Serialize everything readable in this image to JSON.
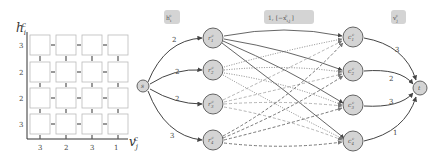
{
  "grid": {
    "y_axis_label": "h",
    "y_axis_sub": "i",
    "y_axis_sup": "c",
    "x_axis_label": "v",
    "x_axis_sub": "j",
    "x_axis_sup": "c",
    "row_labels": [
      "3",
      "2",
      "2",
      "3"
    ],
    "col_labels": [
      "3",
      "2",
      "3",
      "1"
    ],
    "rows": 4,
    "cols": 4
  },
  "network": {
    "source": {
      "label": "s"
    },
    "sink": {
      "label": "t"
    },
    "left_nodes": [
      {
        "label": "r",
        "sub": "1",
        "sup": "c"
      },
      {
        "label": "r",
        "sub": "2",
        "sup": "c"
      },
      {
        "label": "r",
        "sub": "3",
        "sup": "c"
      },
      {
        "label": "r",
        "sub": "4",
        "sup": "c"
      }
    ],
    "right_nodes": [
      {
        "label": "c",
        "sub": "1",
        "sup": "c"
      },
      {
        "label": "c",
        "sub": "2",
        "sup": "c"
      },
      {
        "label": "c",
        "sub": "3",
        "sup": "c"
      },
      {
        "label": "c",
        "sub": "4",
        "sup": "c"
      }
    ],
    "source_edge_weights": [
      "2",
      "2",
      "2",
      "3"
    ],
    "sink_edge_weights": [
      "3",
      "2",
      "3",
      "1"
    ],
    "tags": {
      "left": "h_i^c",
      "middle": "1, [−x_{i,j}^c]",
      "right": "v_j^c"
    },
    "edge_styles": [
      "solid",
      "dotted",
      "light-dashed",
      "dashed"
    ]
  }
}
